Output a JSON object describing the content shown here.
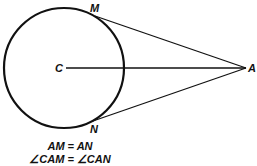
{
  "diagram": {
    "points": {
      "center": "C",
      "external": "A",
      "tangent_top": "M",
      "tangent_bottom": "N"
    },
    "equations": [
      "AM = AN",
      "∠CAM = ∠CAN"
    ],
    "colors": {
      "stroke": "#111111",
      "background": "#ffffff"
    }
  }
}
